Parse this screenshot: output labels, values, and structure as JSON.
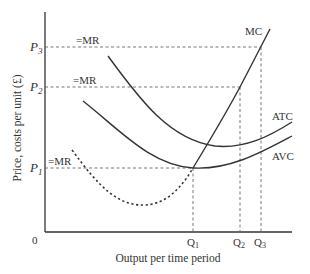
{
  "diagram": {
    "y_axis_label": "Price, costs per unit (£)",
    "x_axis_label": "Output per time period",
    "origin_label": "0",
    "price_levels": [
      {
        "label": "P",
        "sub": "3",
        "mr_label": "=MR"
      },
      {
        "label": "P",
        "sub": "2",
        "mr_label": "=MR"
      },
      {
        "label": "P",
        "sub": "1",
        "mr_label": "=MR"
      }
    ],
    "quantity_levels": [
      {
        "label": "Q",
        "sub": "1"
      },
      {
        "label": "Q",
        "sub": "2"
      },
      {
        "label": "Q",
        "sub": "3"
      }
    ],
    "curves": [
      {
        "name": "MC",
        "label": "MC"
      },
      {
        "name": "ATC",
        "label": "ATC"
      },
      {
        "name": "AVC",
        "label": "AVC"
      }
    ],
    "colors": {
      "line": "#333333",
      "dashed": "#666666"
    }
  }
}
